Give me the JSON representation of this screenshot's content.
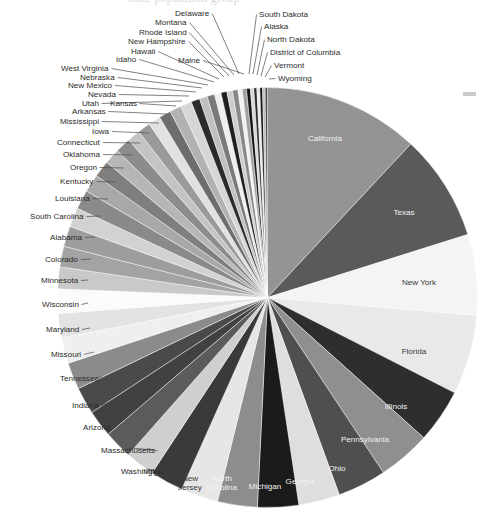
{
  "page": {
    "title_fragment": "state population group",
    "background_color": "#ffffff",
    "edge_mark_color": "#c9c9c9"
  },
  "chart_data": {
    "type": "pie",
    "title": "",
    "subtitle": "",
    "xlabel": "",
    "ylabel": "",
    "legend_position": "none",
    "grid": false,
    "label_mode": "slice-labels-with-leader-lines",
    "start_angle_deg": -90,
    "direction": "clockwise",
    "categories": [
      "California",
      "Texas",
      "New York",
      "Florida",
      "Illinois",
      "Pennsylvania",
      "Ohio",
      "Georgia",
      "Michigan",
      "North Carolina",
      "New Jersey",
      "Virginia",
      "Washington",
      "Massachusetts",
      "Arizona",
      "Indiana",
      "Tennessee",
      "Missouri",
      "Maryland",
      "Wisconsin",
      "Minnesota",
      "Colorado",
      "Alabama",
      "South Carolina",
      "Louisiana",
      "Kentucky",
      "Oregon",
      "Oklahoma",
      "Connecticut",
      "Iowa",
      "Mississippi",
      "Arkansas",
      "Kansas",
      "Utah",
      "Nevada",
      "New Mexico",
      "Nebraska",
      "West Virginia",
      "Idaho",
      "Hawaii",
      "Maine",
      "New Hampshire",
      "Rhode Island",
      "Montana",
      "Delaware",
      "South Dakota",
      "Alaska",
      "North Dakota",
      "District of Columbia",
      "Vermont",
      "Wyoming"
    ],
    "values": [
      12.1,
      8.3,
      6.3,
      6.2,
      4.2,
      4.1,
      3.8,
      3.2,
      3.2,
      3.1,
      2.9,
      2.6,
      2.3,
      2.2,
      2.1,
      2.1,
      2.1,
      2.0,
      1.9,
      1.9,
      1.7,
      1.6,
      1.6,
      1.5,
      1.5,
      1.4,
      1.3,
      1.2,
      1.2,
      1.0,
      1.0,
      0.95,
      0.93,
      0.9,
      0.88,
      0.67,
      0.61,
      0.59,
      0.51,
      0.46,
      0.43,
      0.43,
      0.33,
      0.33,
      0.3,
      0.27,
      0.23,
      0.23,
      0.21,
      0.2,
      0.18
    ],
    "units": "millions of people",
    "slice_colors": [
      "#949494",
      "#5a5a5a",
      "#f4f4f4",
      "#e9e9e9",
      "#2e2e2e",
      "#8f8f8f",
      "#4f4f4f",
      "#dededc",
      "#1b1b1b",
      "#8d8d8d",
      "#e6e6e4",
      "#3a3a3a",
      "#cfcfcf",
      "#5b5b5b",
      "#414141",
      "#4a4a4a",
      "#8b8b8b",
      "#efefef",
      "#e3e3e1",
      "#fbfbfb",
      "#c9c9c9",
      "#a3a3a3",
      "#9d9d9d",
      "#d2d2d0",
      "#8a8a8a",
      "#a8a8a8",
      "#7f7f7f",
      "#b6b6b6",
      "#8c8c8c",
      "#c4c4c2",
      "#9a9a9a",
      "#e1e1df",
      "#6d6d6d",
      "#b2b2b2",
      "#d6d6d4",
      "#2b2b2b",
      "#c0c0be",
      "#7a7a7a",
      "#efefed",
      "#1f1f1f",
      "#cdcdcb",
      "#888888",
      "#f2f2f0",
      "#9f9f9f",
      "#151515",
      "#d8d8d6",
      "#2a2a2a",
      "#e8e8e6",
      "#111111",
      "#bdbdbb",
      "#4c4c4c"
    ],
    "labels_inside": [
      "California",
      "Texas",
      "Illinois",
      "Pennsylvania",
      "Ohio",
      "Georgia",
      "Michigan",
      "North Carolina"
    ],
    "labels_inside_light": [
      "New York",
      "Florida",
      "New Jersey",
      "Virginia"
    ]
  },
  "labels": {
    "inside": [
      {
        "name": "California",
        "x": 325,
        "y": 141,
        "tone": "dark-bg"
      },
      {
        "name": "Texas",
        "x": 404,
        "y": 215,
        "tone": "dark-bg"
      },
      {
        "name": "New York",
        "x": 419,
        "y": 285,
        "tone": "light-bg"
      },
      {
        "name": "Florida",
        "x": 414,
        "y": 354,
        "tone": "light-bg"
      },
      {
        "name": "Illinois",
        "x": 396,
        "y": 409,
        "tone": "dark-bg"
      },
      {
        "name": "Pennsylvania",
        "x": 365,
        "y": 442,
        "tone": "dark-bg"
      },
      {
        "name": "Ohio",
        "x": 337,
        "y": 471,
        "tone": "dark-bg"
      },
      {
        "name": "Georgia",
        "x": 300,
        "y": 484,
        "tone": "dark-bg"
      },
      {
        "name": "Michigan",
        "x": 265,
        "y": 489,
        "tone": "dark-bg"
      },
      {
        "name": "North Carolina",
        "x": 222,
        "y": 481,
        "tone": "dark-bg"
      },
      {
        "name": "New Jersey",
        "x": 190,
        "y": 481,
        "tone": "light-bg"
      },
      {
        "name": "Virginia",
        "x": 157,
        "y": 474,
        "tone": "light-bg"
      }
    ],
    "outside_left": [
      {
        "name": "Washington",
        "x": 121,
        "y": 474,
        "tx": 146,
        "ty": 469
      },
      {
        "name": "Massachusetts",
        "x": 101,
        "y": 453,
        "tx": 131,
        "ty": 448
      },
      {
        "name": "Arizona",
        "x": 83,
        "y": 430,
        "tx": 118,
        "ty": 425
      },
      {
        "name": "Indiana",
        "x": 72,
        "y": 408,
        "tx": 108,
        "ty": 403
      },
      {
        "name": "Tennessee",
        "x": 60,
        "y": 381,
        "tx": 100,
        "ty": 376
      },
      {
        "name": "Missouri",
        "x": 51,
        "y": 357,
        "tx": 94,
        "ty": 352
      },
      {
        "name": "Maryland",
        "x": 46,
        "y": 332,
        "tx": 90,
        "ty": 328
      },
      {
        "name": "Wisconsin",
        "x": 42,
        "y": 307,
        "tx": 88,
        "ty": 303
      },
      {
        "name": "Minnesota",
        "x": 41,
        "y": 283,
        "tx": 88,
        "ty": 280
      },
      {
        "name": "Colorado",
        "x": 45,
        "y": 262,
        "tx": 91,
        "ty": 259
      },
      {
        "name": "Alabama",
        "x": 50,
        "y": 240,
        "tx": 95,
        "ty": 237
      },
      {
        "name": "South Carolina",
        "x": 30,
        "y": 219,
        "tx": 101,
        "ty": 216
      },
      {
        "name": "Louisiana",
        "x": 55,
        "y": 201,
        "tx": 108,
        "ty": 199
      },
      {
        "name": "Kentucky",
        "x": 60,
        "y": 184,
        "tx": 116,
        "ty": 182
      },
      {
        "name": "Oregon",
        "x": 70,
        "y": 170,
        "tx": 124,
        "ty": 168
      },
      {
        "name": "Oklahoma",
        "x": 63,
        "y": 157,
        "tx": 132,
        "ty": 155
      },
      {
        "name": "Connecticut",
        "x": 57,
        "y": 145,
        "tx": 140,
        "ty": 143
      },
      {
        "name": "Iowa",
        "x": 92,
        "y": 134,
        "tx": 149,
        "ty": 133
      },
      {
        "name": "Mississippi",
        "x": 60,
        "y": 124,
        "tx": 159,
        "ty": 123
      },
      {
        "name": "Arkansas",
        "x": 72,
        "y": 114,
        "tx": 167,
        "ty": 114
      },
      {
        "name": "Kansas",
        "x": 110,
        "y": 106,
        "tx": 176,
        "ty": 106
      },
      {
        "name": "Utah",
        "x": 82,
        "y": 106,
        "tx": 182,
        "ty": 101
      },
      {
        "name": "Nevada",
        "x": 88,
        "y": 97,
        "tx": 189,
        "ty": 96
      },
      {
        "name": "New Mexico",
        "x": 68,
        "y": 88,
        "tx": 196,
        "ty": 92
      },
      {
        "name": "Nebraska",
        "x": 80,
        "y": 80,
        "tx": 202,
        "ty": 88
      },
      {
        "name": "West Virginia",
        "x": 61,
        "y": 71,
        "tx": 208,
        "ty": 85
      },
      {
        "name": "Idaho",
        "x": 116,
        "y": 62,
        "tx": 214,
        "ty": 82
      },
      {
        "name": "Hawaii",
        "x": 131,
        "y": 54,
        "tx": 219,
        "ty": 79
      },
      {
        "name": "New Hampshire",
        "x": 128,
        "y": 44,
        "tx": 224,
        "ty": 77
      },
      {
        "name": "Rhode Island",
        "x": 139,
        "y": 35,
        "tx": 229,
        "ty": 76
      },
      {
        "name": "Montana",
        "x": 155,
        "y": 25,
        "tx": 234,
        "ty": 75
      },
      {
        "name": "Delaware",
        "x": 175,
        "y": 16,
        "tx": 239,
        "ty": 74
      },
      {
        "name": "Maine",
        "x": 178,
        "y": 63,
        "tx": 244,
        "ty": 74
      }
    ],
    "outside_right": [
      {
        "name": "South Dakota",
        "x": 259,
        "y": 17,
        "tx": 249,
        "ty": 74
      },
      {
        "name": "Alaska",
        "x": 264,
        "y": 29,
        "tx": 253,
        "ty": 74
      },
      {
        "name": "North Dakota",
        "x": 267,
        "y": 42,
        "tx": 257,
        "ty": 75
      },
      {
        "name": "District of Columbia",
        "x": 270,
        "y": 55,
        "tx": 261,
        "ty": 76
      },
      {
        "name": "Vermont",
        "x": 274,
        "y": 68,
        "tx": 265,
        "ty": 77
      },
      {
        "name": "Wyoming",
        "x": 278,
        "y": 81,
        "tx": 269,
        "ty": 79
      }
    ]
  }
}
